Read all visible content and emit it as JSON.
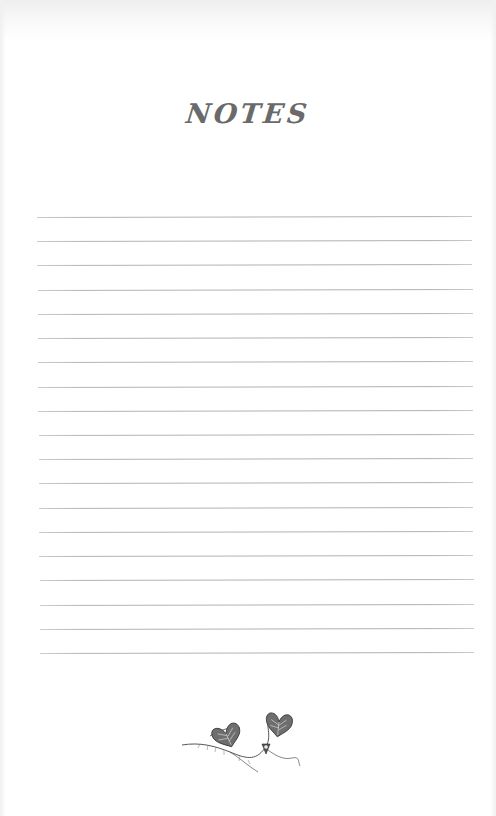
{
  "page": {
    "title": "NOTES",
    "ruled_line_count": 19,
    "line_color": "#b4b4b4",
    "title_color": "#6a6a6a",
    "ornament": "vine-with-heart-leaves-illustration"
  }
}
